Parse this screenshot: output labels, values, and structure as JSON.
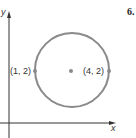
{
  "problem_number": "6.",
  "axes": {
    "x_label": "x",
    "y_label": "y"
  },
  "circle": {
    "stroke_color": "#8a8a8a",
    "center_dot_color": "#8a8a8a"
  },
  "points": [
    {
      "label": "(1, 2)",
      "x": 1,
      "y": 2
    },
    {
      "label": "(4, 2)",
      "x": 4,
      "y": 2
    }
  ],
  "colors": {
    "axis": "#333333",
    "circle": "#8a8a8a",
    "text": "#333333"
  }
}
